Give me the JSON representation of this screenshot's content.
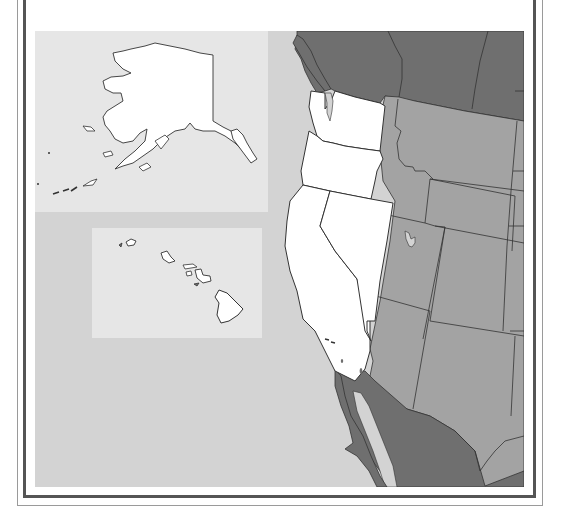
{
  "map": {
    "title": "",
    "region": "Western United States",
    "highlighted_states": [
      "Washington",
      "Oregon",
      "California",
      "Nevada"
    ],
    "other_us_states": [
      "Idaho",
      "Montana",
      "Wyoming",
      "Utah",
      "Arizona",
      "Colorado",
      "New Mexico",
      "North Dakota",
      "South Dakota",
      "Nebraska",
      "Texas"
    ],
    "neighboring_countries": [
      "Canada",
      "Mexico"
    ],
    "insets": [
      {
        "name": "Alaska",
        "highlighted": true
      },
      {
        "name": "Hawaii",
        "highlighted": true
      }
    ],
    "colors": {
      "ocean": "#d3d3d3",
      "inset_background": "#e6e6e6",
      "highlighted_state": "#ffffff",
      "other_state": "#a3a3a3",
      "foreign_country": "#6f6f6f",
      "border": "#333333",
      "lake": "#d3d3d3",
      "frame_thick": "#555555",
      "frame_thin": "#9a9a9a"
    }
  }
}
